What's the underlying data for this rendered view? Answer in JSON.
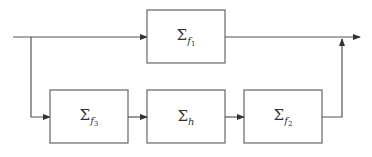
{
  "diagram": {
    "type": "block-diagram",
    "colors": {
      "line": "#555555",
      "box_border": "#666666",
      "text": "#333333",
      "background": "#ffffff"
    },
    "blocks": [
      {
        "id": "top",
        "symbol": "Σ",
        "subscript": "f",
        "sub_index": "1",
        "label": "Σ_{f_1}"
      },
      {
        "id": "bottom_1",
        "symbol": "Σ",
        "subscript": "f",
        "sub_index": "3",
        "label": "Σ_{f_3}"
      },
      {
        "id": "bottom_2",
        "symbol": "Σ",
        "subscript": "h",
        "sub_index": "",
        "label": "Σ_h"
      },
      {
        "id": "bottom_3",
        "symbol": "Σ",
        "subscript": "f",
        "sub_index": "2",
        "label": "Σ_{f_2}"
      }
    ],
    "connections": [
      {
        "from": "input",
        "to": "top"
      },
      {
        "from": "input",
        "to": "bottom_1",
        "via": "branch"
      },
      {
        "from": "bottom_1",
        "to": "bottom_2"
      },
      {
        "from": "bottom_2",
        "to": "bottom_3"
      },
      {
        "from": "top",
        "to": "output"
      },
      {
        "from": "bottom_3",
        "to": "output",
        "via": "junction"
      }
    ]
  }
}
